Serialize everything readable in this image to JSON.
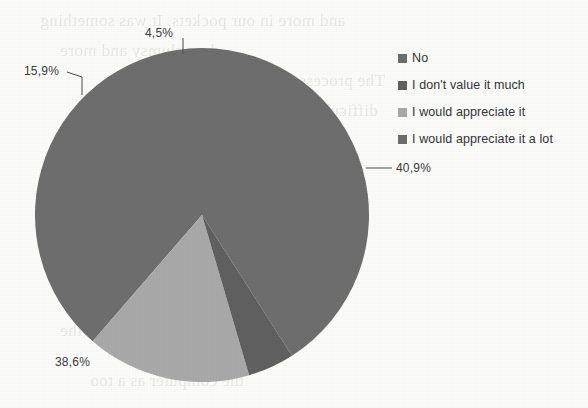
{
  "chart_data": {
    "type": "pie",
    "title": "",
    "categories": [
      "No",
      "I don't value it much",
      "I would appreciate it",
      "I would appreciate it a lot"
    ],
    "values": [
      40.9,
      4.5,
      15.9,
      38.6
    ],
    "value_labels": [
      "40,9%",
      "4,5%",
      "15,9%",
      "38,6%"
    ],
    "colors": [
      "#6e6e6e",
      "#606060",
      "#a9a9a9",
      "#6e6e6e"
    ],
    "legend_position": "right",
    "grid": false,
    "start_angle_deg": 0,
    "direction": "clockwise"
  },
  "labels": {
    "slice_0": "40,9%",
    "slice_1": "4,5%",
    "slice_2": "15,9%",
    "slice_3": "38,6%"
  },
  "legend": {
    "items": [
      {
        "label": "No",
        "color": "#6e6e6e"
      },
      {
        "label": "I don't value it much",
        "color": "#606060"
      },
      {
        "label": "I would appreciate it",
        "color": "#a9a9a9"
      },
      {
        "label": "I would appreciate it a lot",
        "color": "#6e6e6e"
      }
    ]
  },
  "background": {
    "ghost_text": [
      "and more in our pockets. It was something",
      "less clumsy and more",
      "The process of diffusion",
      "difficult to under-",
      "and the appearance of new",
      "led to a complete",
      "economy within",
      "Table is very similar to the",
      "the computer as a too"
    ]
  },
  "colors": {
    "page_background": "#fbfbfa",
    "label_text": "#3b3b3b",
    "legend_text": "#343434",
    "leader_line": "#4a4a4a"
  }
}
